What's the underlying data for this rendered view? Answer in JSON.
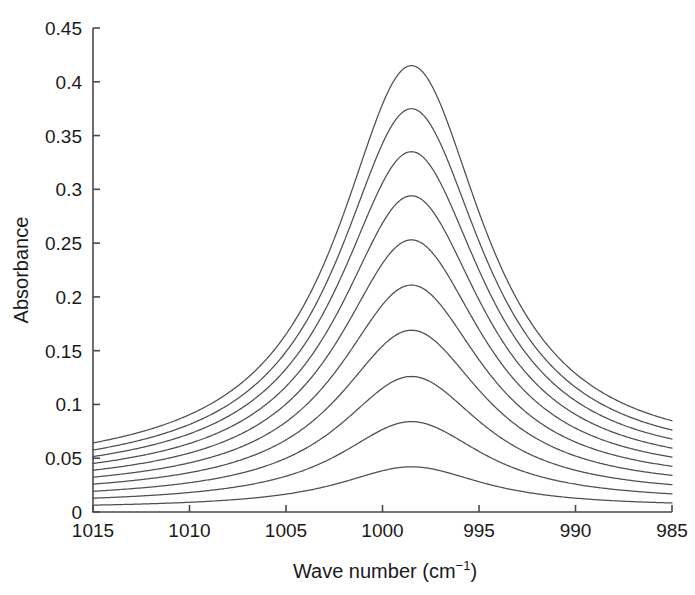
{
  "figure": {
    "background_color": "#ffffff",
    "curve_color": "#4f4f4f",
    "axis_color": "#4a4a4a"
  },
  "chart_data": {
    "type": "line",
    "title": "",
    "xlabel": "Wave number (cm−1)",
    "xlabel_text": "Wave number (cm",
    "xlabel_sup": "−1",
    "xlabel_close": ")",
    "ylabel": "Absorbance",
    "xlim": [
      1015,
      985
    ],
    "ylim": [
      0,
      0.45
    ],
    "x_reversed": true,
    "grid": false,
    "legend": null,
    "xticks": [
      1015,
      1010,
      1005,
      1000,
      995,
      990,
      985
    ],
    "xtick_labels": [
      "1015",
      "1010",
      "1005",
      "1000",
      "995",
      "990",
      "985"
    ],
    "yticks": [
      0,
      0.05,
      0.1,
      0.15,
      0.2,
      0.25,
      0.3,
      0.35,
      0.4,
      0.45
    ],
    "ytick_labels": [
      "0",
      "0.05",
      "0.1",
      "0.15",
      "0.2",
      "0.25",
      "0.3",
      "0.35",
      "0.4",
      "0.45"
    ],
    "peak_center": 998.5,
    "peak_width_hwhm": 4.6,
    "baseline_slope_note": "sloping baseline rising toward 1015",
    "series": [
      {
        "name": "1",
        "peak_absorbance": 0.0415,
        "baseline_left": 0.037,
        "baseline_right": 0.0465
      },
      {
        "name": "2",
        "peak_absorbance": 0.0375,
        "baseline_left": 0.033,
        "baseline_right": 0.0415
      },
      {
        "name": "3",
        "peak_absorbance": 0.0335,
        "baseline_left": 0.0295,
        "baseline_right": 0.0368
      },
      {
        "name": "4",
        "peak_absorbance": 0.0294,
        "baseline_left": 0.0258,
        "baseline_right": 0.0322
      },
      {
        "name": "5",
        "peak_absorbance": 0.0253,
        "baseline_left": 0.0222,
        "baseline_right": 0.0276
      },
      {
        "name": "6",
        "peak_absorbance": 0.0211,
        "baseline_left": 0.0185,
        "baseline_right": 0.023
      },
      {
        "name": "7",
        "peak_absorbance": 0.0169,
        "baseline_left": 0.0148,
        "baseline_right": 0.0184
      },
      {
        "name": "8",
        "peak_absorbance": 0.0126,
        "baseline_left": 0.011,
        "baseline_right": 0.0137
      },
      {
        "name": "9",
        "peak_absorbance": 0.0084,
        "baseline_left": 0.0073,
        "baseline_right": 0.0091
      },
      {
        "name": "10",
        "peak_absorbance": 0.0042,
        "baseline_left": 0.0036,
        "baseline_right": 0.0045
      }
    ],
    "series_peak_values": [
      0.415,
      0.375,
      0.335,
      0.294,
      0.253,
      0.211,
      0.169,
      0.126,
      0.084,
      0.042
    ],
    "series_count": 10
  }
}
